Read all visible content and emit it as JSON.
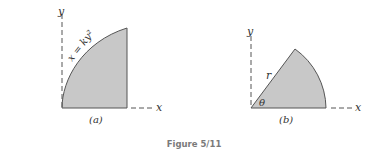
{
  "figure": {
    "caption": "Figure 5/11",
    "fill_color": "#c8c8c8",
    "stroke_color": "#555555",
    "panels": [
      {
        "id": "a",
        "label": "(a)",
        "x_axis_label": "x",
        "y_axis_label": "y",
        "curve_label": "x = ky²",
        "shape": "area under parabola x = ky^2 bounded by vertical line and x-axis"
      },
      {
        "id": "b",
        "label": "(b)",
        "x_axis_label": "x",
        "y_axis_label": "y",
        "radius_label": "r",
        "angle_label": "θ",
        "shape": "circular sector of radius r and angle θ"
      }
    ]
  }
}
